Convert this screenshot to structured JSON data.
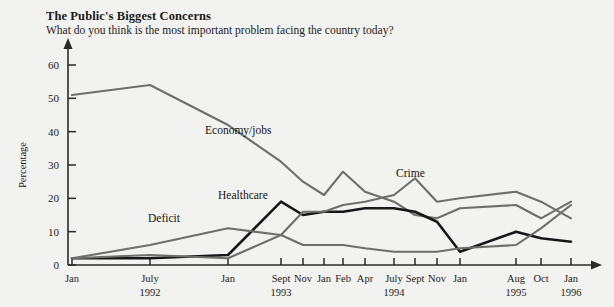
{
  "header": {
    "title": "The Public's Biggest Concerns",
    "subtitle": "What do you think is the most important problem facing the country today?"
  },
  "chart_data": {
    "type": "line",
    "title": "The Public's Biggest Concerns",
    "subtitle": "What do you think is the most important problem facing the country today?",
    "xlabel": "",
    "ylabel": "Percentage",
    "ylim": [
      0,
      65
    ],
    "yticks": [
      0,
      10,
      20,
      30,
      40,
      50,
      60
    ],
    "grid": false,
    "legend": "inline-annotations",
    "x_tick_labels": [
      "Jan",
      "July",
      "Jan",
      "Sept",
      "Nov",
      "Jan",
      "Feb",
      "Apr",
      "July",
      "Sept",
      "Nov",
      "Jan",
      "Aug",
      "Oct",
      "Jan"
    ],
    "x_year_labels": [
      {
        "label": "1992",
        "at": "July"
      },
      {
        "label": "1993",
        "at": "Sept"
      },
      {
        "label": "1994",
        "at": "July"
      },
      {
        "label": "1995",
        "at": "Aug"
      },
      {
        "label": "1996",
        "at": "Jan"
      }
    ],
    "x": [
      "Jan 1992",
      "July 1992",
      "Jan 1993",
      "Sept 1993",
      "Nov 1993",
      "Jan 1994",
      "Feb 1994",
      "Apr 1994",
      "July 1994",
      "Sept 1994",
      "Nov 1994",
      "Jan 1995",
      "Aug 1995",
      "Oct 1995",
      "Jan 1996"
    ],
    "series": [
      {
        "name": "Economy/jobs",
        "color": "#6e6e6b",
        "emphasis": "normal",
        "values": [
          51,
          54,
          42,
          31,
          25,
          21,
          28,
          22,
          19,
          15,
          14,
          17,
          18,
          14,
          19
        ]
      },
      {
        "name": "Healthcare",
        "color": "#17171a",
        "emphasis": "bold",
        "values": [
          2,
          2,
          3,
          19,
          15,
          16,
          16,
          17,
          17,
          16,
          13,
          4,
          10,
          8,
          7
        ]
      },
      {
        "name": "Deficit",
        "color": "#6e6e6b",
        "emphasis": "normal",
        "values": [
          2,
          6,
          11,
          9,
          6,
          6,
          6,
          5,
          4,
          4,
          4,
          5,
          6,
          11,
          18
        ]
      },
      {
        "name": "Crime",
        "color": "#6e6e6b",
        "emphasis": "normal",
        "values": [
          2,
          3,
          2,
          9,
          16,
          16,
          18,
          19,
          21,
          26,
          19,
          20,
          22,
          19,
          14
        ]
      }
    ],
    "annotations": [
      {
        "text": "Economy/jobs",
        "x": 205,
        "y": 134
      },
      {
        "text": "Healthcare",
        "x": 218,
        "y": 199
      },
      {
        "text": "Deficit",
        "x": 148,
        "y": 222
      },
      {
        "text": "Crime",
        "x": 396,
        "y": 177
      }
    ]
  }
}
